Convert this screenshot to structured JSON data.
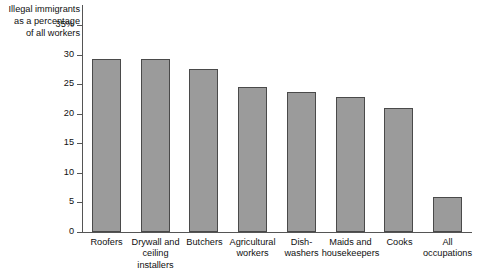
{
  "chart_data": {
    "type": "bar",
    "title": "",
    "ylabel": "Illegal immigrants\nas a percentage\nof all workers",
    "xlabel": "",
    "ylim": [
      0,
      35
    ],
    "grid": false,
    "legend": "none",
    "y_ticks": [
      "0",
      "5",
      "10",
      "15",
      "20",
      "25",
      "30",
      "35%"
    ],
    "y_tick_values": [
      0,
      5,
      10,
      15,
      20,
      25,
      30,
      35
    ],
    "categories": [
      "Roofers",
      "Drywall and\nceiling installers",
      "Butchers",
      "Agricultural\nworkers",
      "Dish-\nwashers",
      "Maids and\nhousekeepers",
      "Cooks",
      "All\noccupations"
    ],
    "values": [
      29.2,
      29.3,
      27.5,
      24.5,
      23.7,
      22.8,
      21.0,
      5.9
    ],
    "bar_color": "#9b9b9b",
    "bar_border_color": "#4a4a4a",
    "axis_color": "#555555"
  }
}
